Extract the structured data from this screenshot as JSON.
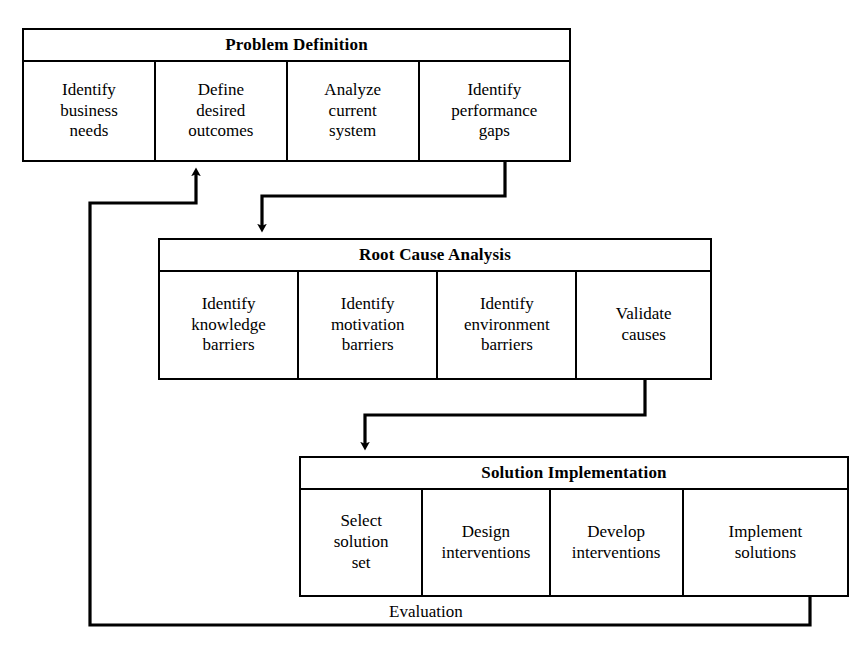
{
  "diagram": {
    "stroke_color": "#000000",
    "background_color": "#ffffff"
  },
  "stages": [
    {
      "id": "problem-definition",
      "header": "Problem Definition",
      "cells": [
        "Identify\nbusiness\nneeds",
        "Define\ndesired\noutcomes",
        "Analyze\ncurrent\nsystem",
        "Identify\nperformance\ngaps"
      ]
    },
    {
      "id": "root-cause-analysis",
      "header": "Root Cause Analysis",
      "cells": [
        "Identify\nknowledge\nbarriers",
        "Identify\nmotivation\nbarriers",
        "Identify\nenvironment\nbarriers",
        "Validate\ncauses"
      ]
    },
    {
      "id": "solution-implementation",
      "header": "Solution Implementation",
      "cells": [
        "Select\nsolution\nset",
        "Design\ninterventions",
        "Develop\ninterventions",
        "Implement\nsolutions"
      ]
    }
  ],
  "connectors": {
    "problem_to_root": "Problem Definition to Root Cause Analysis",
    "root_to_solution": "Root Cause Analysis to Solution Implementation",
    "feedback_label": "Evaluation",
    "feedback_path": "Solution Implementation back to Problem Definition"
  }
}
